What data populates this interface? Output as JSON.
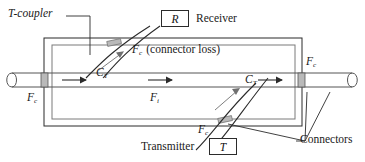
{
  "figure": {
    "kind": "fiber-optic-t-coupler-diagram",
    "title": "",
    "labels": {
      "t_coupler": "T-coupler",
      "receiver": "Receiver",
      "transmitter": "Transmitter",
      "connectors": "Connectors",
      "connector_loss_paren": "(connector loss)"
    },
    "boxes": [
      {
        "name": "receiver-box",
        "symbol": "R"
      },
      {
        "name": "transmitter-box",
        "symbol": "T"
      }
    ],
    "variables": {
      "fc": {
        "base": "F",
        "sub": "c"
      },
      "fi": {
        "base": "F",
        "sub": "i"
      },
      "ct": {
        "base": "C",
        "sub": "T"
      }
    },
    "annotations": [
      {
        "name": "fc-left",
        "base": "F",
        "sub": "c"
      },
      {
        "name": "fc-upper-connector-loss",
        "base": "F",
        "sub": "c"
      },
      {
        "name": "fc-right",
        "base": "F",
        "sub": "c"
      },
      {
        "name": "fc-lower-transmitter",
        "base": "F",
        "sub": "c"
      },
      {
        "name": "fi-through",
        "base": "F",
        "sub": "i"
      },
      {
        "name": "ct-upper",
        "base": "C",
        "sub": "T"
      },
      {
        "name": "ct-lower",
        "base": "C",
        "sub": "T"
      }
    ],
    "colors": {
      "stroke": "#2b2b2b",
      "stroke_light": "#6f6f6f",
      "connector_fill": "#b9b9b9",
      "background": "#ffffff",
      "text": "#1a1a1a"
    },
    "flow_arrows": 3
  }
}
